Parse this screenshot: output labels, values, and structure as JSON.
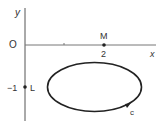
{
  "diagram": {
    "axes": {
      "x_label": "x",
      "y_label": "y",
      "origin_label": "O"
    },
    "points": [
      {
        "name": "M",
        "value_label": "2",
        "coords": [
          2,
          0
        ]
      },
      {
        "name": "L",
        "value_label": "−1",
        "coords": [
          0,
          -1
        ]
      }
    ],
    "curve": {
      "label": "C",
      "type": "ellipse",
      "center": [
        1.75,
        -1
      ],
      "direction": "clockwise arrow at lower right"
    },
    "tick_marks": [
      1,
      2
    ],
    "colors": {
      "axis": "#555555",
      "curve": "#222222",
      "text": "#333333"
    }
  }
}
